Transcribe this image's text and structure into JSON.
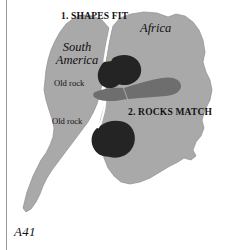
{
  "figure": {
    "caption": "A41",
    "colors": {
      "page_background": "#ffffff",
      "landmass": "#a9a9a9",
      "landmass_outline": "#8f8f8f",
      "old_rock_dark": "#242424",
      "rock_band_gray": "#6e6e6e",
      "seam": "#ffffff",
      "margin_rule": "#9a9a9a",
      "text": "#111111"
    }
  },
  "callouts": [
    {
      "id": "shapes-fit",
      "label": "1. SHAPES FIT"
    },
    {
      "id": "rocks-match",
      "label": "2. ROCKS MATCH"
    }
  ],
  "continents": [
    {
      "id": "south-america",
      "line1": "South",
      "line2": "America"
    },
    {
      "id": "africa",
      "label": "Africa"
    }
  ],
  "rock_labels": [
    {
      "id": "old-rock-north",
      "label": "Old rock"
    },
    {
      "id": "old-rock-south",
      "label": "Old rock"
    }
  ]
}
